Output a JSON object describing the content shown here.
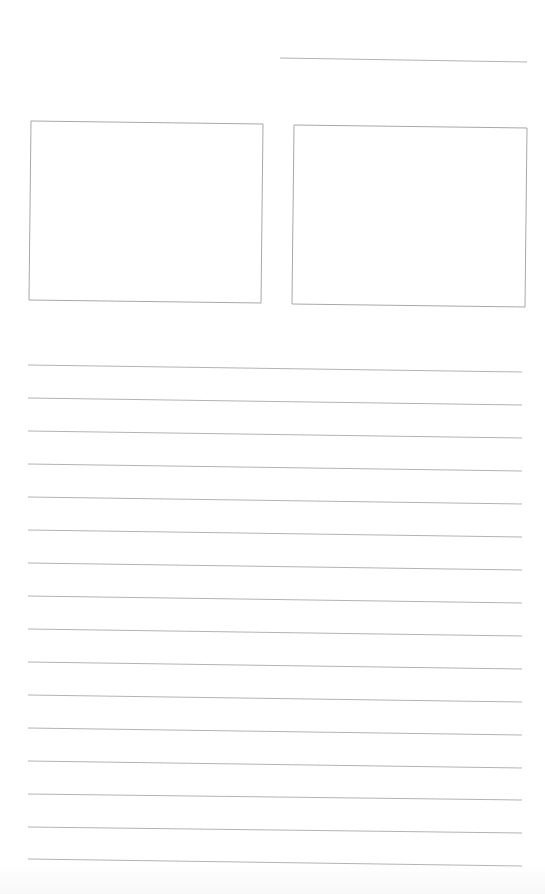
{
  "page": {
    "type": "blank-writing-worksheet",
    "background": "#ffffff",
    "line_color": "#b3b3b3"
  },
  "name_line": {
    "x1": 280,
    "y1": 58,
    "x2": 527,
    "y2": 62
  },
  "picture_boxes": [
    {
      "name": "picture-box-left",
      "points": "31,121 263,124 261,303 29,300"
    },
    {
      "name": "picture-box-right",
      "points": "294,125 527,128 525,307 292,304"
    }
  ],
  "writing_lines": [
    {
      "y1": 365,
      "y2": 372
    },
    {
      "y1": 398,
      "y2": 405
    },
    {
      "y1": 431,
      "y2": 438
    },
    {
      "y1": 464,
      "y2": 471
    },
    {
      "y1": 497,
      "y2": 504
    },
    {
      "y1": 530,
      "y2": 537
    },
    {
      "y1": 563,
      "y2": 570
    },
    {
      "y1": 596,
      "y2": 603
    },
    {
      "y1": 629,
      "y2": 636
    },
    {
      "y1": 662,
      "y2": 669
    },
    {
      "y1": 695,
      "y2": 702
    },
    {
      "y1": 728,
      "y2": 735
    },
    {
      "y1": 761,
      "y2": 768
    },
    {
      "y1": 794,
      "y2": 800
    },
    {
      "y1": 827,
      "y2": 833
    },
    {
      "y1": 859,
      "y2": 866
    }
  ],
  "writing_line_x": {
    "x1": 28,
    "x2": 522
  }
}
